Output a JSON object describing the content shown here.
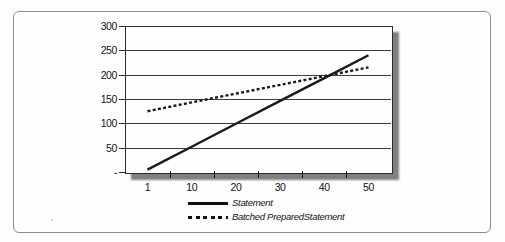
{
  "figure": {
    "background": "#fefefe",
    "frame_border_color": "#8e8e8e"
  },
  "chart_data": {
    "type": "line",
    "title": "",
    "xlabel": "",
    "ylabel": "",
    "categories": [
      "1",
      "10",
      "20",
      "30",
      "40",
      "50"
    ],
    "series": [
      {
        "name": "Statement",
        "style": "solid",
        "color": "#1a1a1a",
        "values": [
          5,
          52,
          99,
          146,
          193,
          240
        ]
      },
      {
        "name": "Batched PreparedStatement",
        "style": "dotted",
        "color": "#1a1a1a",
        "values": [
          125,
          143,
          161,
          179,
          197,
          215
        ]
      }
    ],
    "ylim": [
      0,
      300
    ],
    "ytick_values": [
      0,
      50,
      100,
      150,
      200,
      250,
      300
    ],
    "ytick_labels": [
      "-",
      "50",
      "100",
      "150",
      "200",
      "250",
      "300"
    ],
    "grid": "horizontal",
    "legend_position": "bottom",
    "axis_color": "#2b2b2b",
    "gridline_color": "#3c3c3c"
  }
}
